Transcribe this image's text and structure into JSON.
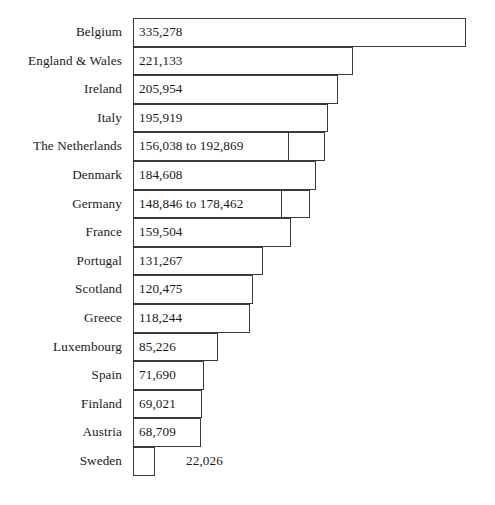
{
  "chart_data": {
    "type": "bar",
    "orientation": "horizontal",
    "title": "",
    "subtitle": "",
    "xlabel": "",
    "ylabel": "",
    "grid": false,
    "legend": null,
    "axis_visible": false,
    "tick_labels": [],
    "xlim": [
      0,
      340000
    ],
    "value_label_position": "inside-bar-left",
    "categories": [
      "Belgium",
      "England & Wales",
      "Ireland",
      "Italy",
      "The Netherlands",
      "Denmark",
      "Germany",
      "France",
      "Portugal",
      "Scotland",
      "Greece",
      "Luxembourg",
      "Spain",
      "Finland",
      "Austria",
      "Sweden"
    ],
    "values": [
      335278,
      221133,
      205954,
      195919,
      192869,
      184608,
      178462,
      159504,
      131267,
      120475,
      118244,
      85226,
      71690,
      69021,
      68709,
      22026
    ],
    "value_labels": [
      "335,278",
      "221,133",
      "205,954",
      "195,919",
      "156,038 to 192,869",
      "184,608",
      "148,846 to 178,462",
      "159,504",
      "131,267",
      "120,475",
      "118,244",
      "85,226",
      "71,690",
      "69,021",
      "68,709",
      "22,026"
    ],
    "range_bounds": [
      null,
      null,
      null,
      null,
      [
        156038,
        192869
      ],
      null,
      [
        148846,
        178462
      ],
      null,
      null,
      null,
      null,
      null,
      null,
      null,
      null,
      null
    ],
    "bars": [
      {
        "label": "Belgium",
        "value_label": "335,278",
        "value": 335278,
        "lower": null,
        "upper": null,
        "label_inside": true
      },
      {
        "label": "England & Wales",
        "value_label": "221,133",
        "value": 221133,
        "lower": null,
        "upper": null,
        "label_inside": true
      },
      {
        "label": "Ireland",
        "value_label": "205,954",
        "value": 205954,
        "lower": null,
        "upper": null,
        "label_inside": true
      },
      {
        "label": "Italy",
        "value_label": "195,919",
        "value": 195919,
        "lower": null,
        "upper": null,
        "label_inside": true
      },
      {
        "label": "The Netherlands",
        "value_label": "156,038 to 192,869",
        "value": 192869,
        "lower": 156038,
        "upper": 192869,
        "label_inside": true
      },
      {
        "label": "Denmark",
        "value_label": "184,608",
        "value": 184608,
        "lower": null,
        "upper": null,
        "label_inside": true
      },
      {
        "label": "Germany",
        "value_label": "148,846 to 178,462",
        "value": 178462,
        "lower": 148846,
        "upper": 178462,
        "label_inside": true
      },
      {
        "label": "France",
        "value_label": "159,504",
        "value": 159504,
        "lower": null,
        "upper": null,
        "label_inside": true
      },
      {
        "label": "Portugal",
        "value_label": "131,267",
        "value": 131267,
        "lower": null,
        "upper": null,
        "label_inside": true
      },
      {
        "label": "Scotland",
        "value_label": "120,475",
        "value": 120475,
        "lower": null,
        "upper": null,
        "label_inside": true
      },
      {
        "label": "Greece",
        "value_label": "118,244",
        "value": 118244,
        "lower": null,
        "upper": null,
        "label_inside": true
      },
      {
        "label": "Luxembourg",
        "value_label": "85,226",
        "value": 85226,
        "lower": null,
        "upper": null,
        "label_inside": true
      },
      {
        "label": "Spain",
        "value_label": "71,690",
        "value": 71690,
        "lower": null,
        "upper": null,
        "label_inside": true
      },
      {
        "label": "Finland",
        "value_label": "69,021",
        "value": 69021,
        "lower": null,
        "upper": null,
        "label_inside": true
      },
      {
        "label": "Austria",
        "value_label": "68,709",
        "value": 68709,
        "lower": null,
        "upper": null,
        "label_inside": true
      },
      {
        "label": "Sweden",
        "value_label": "22,026",
        "value": 22026,
        "lower": null,
        "upper": null,
        "label_inside": false
      }
    ],
    "colors": {
      "bar_fill": "#ffffff",
      "bar_stroke": "#3a3a3a",
      "text": "#1a1a1a",
      "background": "#ffffff"
    }
  },
  "layout": {
    "bar_origin_x": 133,
    "chart_top_y": 18,
    "row_height": 28.6,
    "px_per_unit": 0.000993
  }
}
